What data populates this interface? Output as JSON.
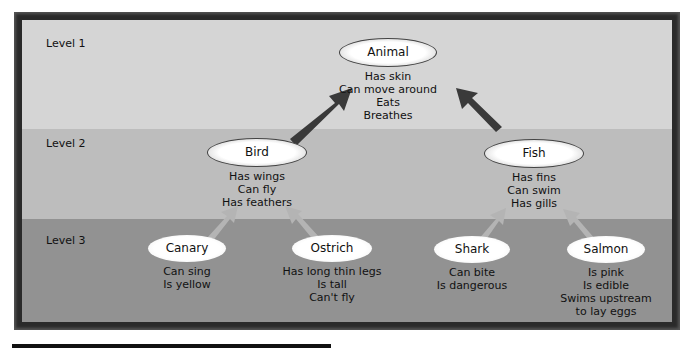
{
  "levels": [
    {
      "label": "Level 1"
    },
    {
      "label": "Level 2"
    },
    {
      "label": "Level 3"
    }
  ],
  "nodes": {
    "animal": {
      "name": "Animal",
      "properties": [
        "Has skin",
        "Can move around",
        "Eats",
        "Breathes"
      ]
    },
    "bird": {
      "name": "Bird",
      "properties": [
        "Has wings",
        "Can fly",
        "Has feathers"
      ]
    },
    "fish": {
      "name": "Fish",
      "properties": [
        "Has fins",
        "Can swim",
        "Has gills"
      ]
    },
    "canary": {
      "name": "Canary",
      "properties": [
        "Can sing",
        "Is yellow"
      ]
    },
    "ostrich": {
      "name": "Ostrich",
      "properties": [
        "Has long thin legs",
        "Is tall",
        "Can't fly"
      ]
    },
    "shark": {
      "name": "Shark",
      "properties": [
        "Can bite",
        "Is dangerous"
      ]
    },
    "salmon": {
      "name": "Salmon",
      "properties": [
        "Is pink",
        "Is edible",
        "Swims upstream",
        "to lay eggs"
      ]
    }
  },
  "edges": [
    {
      "from": "Bird",
      "to": "Animal"
    },
    {
      "from": "Fish",
      "to": "Animal"
    },
    {
      "from": "Canary",
      "to": "Bird"
    },
    {
      "from": "Ostrich",
      "to": "Bird"
    },
    {
      "from": "Shark",
      "to": "Fish"
    },
    {
      "from": "Salmon",
      "to": "Fish"
    }
  ],
  "colors": {
    "level1_band": "#d5d5d5",
    "level2_band": "#bdbdbd",
    "level3_band": "#929292",
    "frame": "#2a2a2a",
    "dark_arrow": "#3a3a3a",
    "light_arrow": "#b4b4b4"
  }
}
